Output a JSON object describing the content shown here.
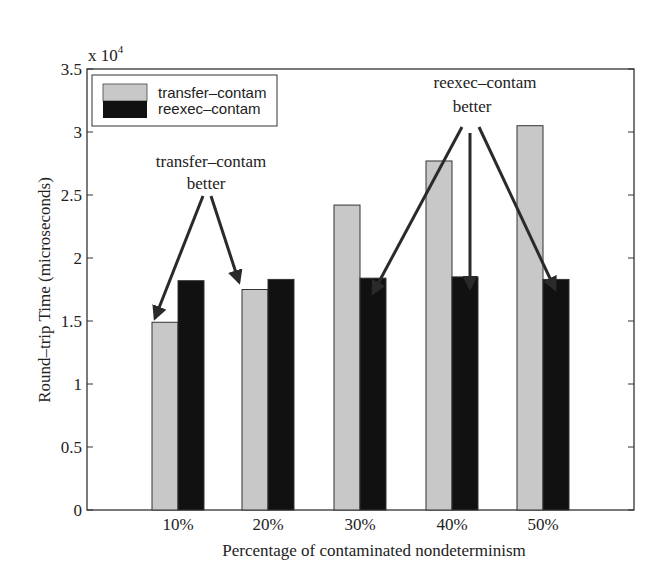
{
  "chart_data": {
    "type": "bar",
    "title": "",
    "xlabel": "Percentage of contaminated nondeterminism",
    "ylabel": "Round–trip Time (microseconds)",
    "y_multiplier": "x 10",
    "y_multiplier_exp": "4",
    "ylim": [
      0,
      35000
    ],
    "yticks": [
      "0",
      "0.5",
      "1",
      "1.5",
      "2",
      "2.5",
      "3",
      "3.5"
    ],
    "categories": [
      "10%",
      "20%",
      "30%",
      "40%",
      "50%"
    ],
    "series": [
      {
        "name": "transfer–contam",
        "color": "#c8c8c8",
        "values": [
          14900,
          17500,
          24200,
          27700,
          30500
        ]
      },
      {
        "name": "reexec–contam",
        "color": "#111111",
        "values": [
          18200,
          18300,
          18400,
          18500,
          18300
        ]
      }
    ],
    "legend_position": "upper left",
    "grid": false,
    "annotations": [
      {
        "line1": "transfer–contam",
        "line2": "better",
        "points_to": [
          "10%",
          "20%"
        ]
      },
      {
        "line1": "reexec–contam",
        "line2": "better",
        "points_to": [
          "30%",
          "40%",
          "50%"
        ]
      }
    ]
  }
}
